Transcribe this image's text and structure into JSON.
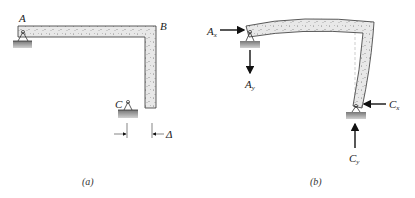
{
  "figure_a": {
    "caption": "(a)",
    "labels": {
      "A": "A",
      "B": "B",
      "C": "C",
      "delta": "Δ"
    },
    "description": "L-shaped concrete frame ABC pinned at A and roller/pin at C, with gap Δ between C support and member end"
  },
  "figure_b": {
    "caption": "(b)",
    "labels": {
      "Ax": "A",
      "Ax_sub": "x",
      "Ay": "A",
      "Ay_sub": "y",
      "Cx": "C",
      "Cx_sub": "x",
      "Cy": "C",
      "Cy_sub": "y"
    },
    "description": "Deformed frame with reactions Ax, Ay at A and Cx, Cy at C"
  },
  "colors": {
    "concrete_fill": "#e6e6e6",
    "outline": "#333333",
    "ground": "#a8a8a8",
    "arrow": "#111111"
  }
}
